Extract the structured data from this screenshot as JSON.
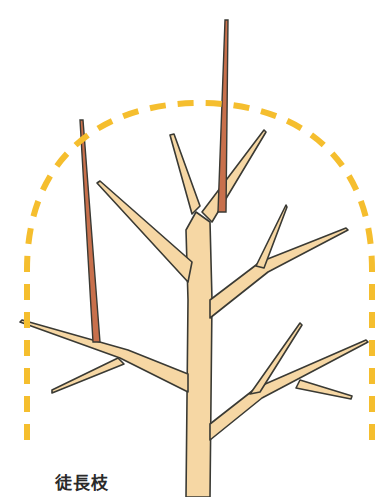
{
  "illustration": {
    "subject": "tree pruning diagram",
    "caption": "徒長枝",
    "colors": {
      "background": "#ffffff",
      "branch_fill": "#f6d7a4",
      "branch_outline": "#3a3a34",
      "water_sprout_fill": "#c8704c",
      "guide_line": "#f5be2e"
    },
    "elements": {
      "guide_outline": "dashed arch marking target crown shape",
      "trunk": "central trunk with lateral branches",
      "water_sprouts": "two vertical reddish shoots"
    }
  }
}
